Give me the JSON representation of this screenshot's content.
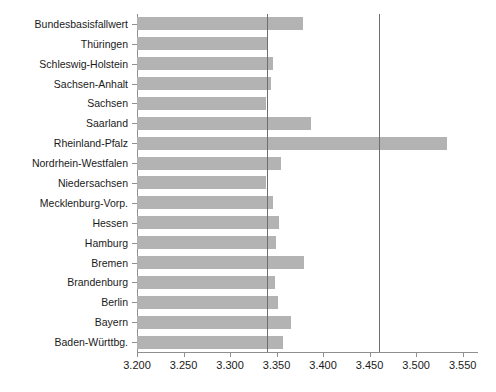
{
  "chart_data": {
    "type": "bar",
    "orientation": "horizontal",
    "title": "",
    "subtitle": "",
    "xlabel": "",
    "ylabel": "",
    "xlim": [
      3.2,
      3.5665
    ],
    "grid": false,
    "legend": null,
    "categories": [
      "Bundesbasisfallwert",
      "Thüringen",
      "Schleswig-Holstein",
      "Sachsen-Anhalt",
      "Sachsen",
      "Saarland",
      "Rheinland-Pfalz",
      "Nordrhein-Westfalen",
      "Niedersachsen",
      "Mecklenburg-Vorp.",
      "Hessen",
      "Hamburg",
      "Bremen",
      "Brandenburg",
      "Berlin",
      "Bayern",
      "Baden-Württbg."
    ],
    "values": [
      3.378,
      3.34,
      3.346,
      3.344,
      3.339,
      3.387,
      3.533,
      3.355,
      3.339,
      3.346,
      3.353,
      3.349,
      3.38,
      3.348,
      3.352,
      3.366,
      3.357
    ],
    "xticks": [
      3.2,
      3.25,
      3.3,
      3.35,
      3.4,
      3.45,
      3.5,
      3.55
    ],
    "xticklabels": [
      "3.200",
      "3.250",
      "3.300",
      "3.350",
      "3.400",
      "3.450",
      "3.500",
      "3.550"
    ],
    "reference_lines": [
      {
        "name": "bundesbasisfallwert-reference",
        "value": 3.34
      },
      {
        "name": "upper-reference",
        "value": 3.46
      }
    ],
    "colors": {
      "bar": "#b3b3b3",
      "axis": "#8f8f8f",
      "reference_line": "#6e6e6e",
      "background": "#ffffff",
      "text": "#1a1a1a"
    }
  }
}
